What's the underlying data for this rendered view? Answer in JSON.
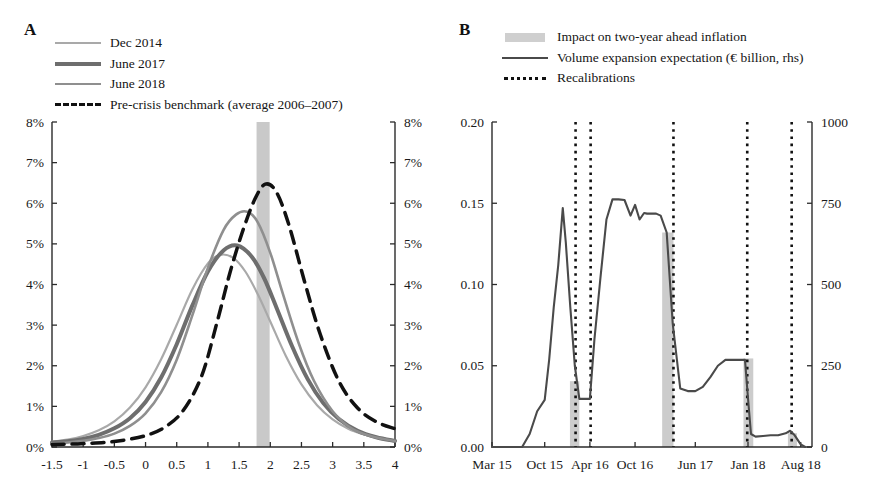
{
  "figure": {
    "panels": [
      {
        "letter": "A",
        "legend": [
          {
            "label": "Dec 2014",
            "marker": "solid-line",
            "color": "#a9a9a9",
            "width": 2.2
          },
          {
            "label": "June 2017",
            "marker": "solid-line",
            "color": "#6e6e6e",
            "width": 4.0
          },
          {
            "label": "June 2018",
            "marker": "solid-line",
            "color": "#8f8f8f",
            "width": 2.6
          },
          {
            "label": "Pre-crisis benchmark (average 2006–2007)",
            "marker": "dashed-line",
            "color": "#111111",
            "width": 3.5
          }
        ]
      },
      {
        "letter": "B",
        "legend": [
          {
            "label": "Impact on two-year ahead inflation",
            "marker": "swatch",
            "color": "#cfcfcf"
          },
          {
            "label": "Volume expansion expectation (€ billion, rhs)",
            "marker": "solid-line",
            "color": "#4a4a4a",
            "width": 2.2
          },
          {
            "label": "Recalibrations",
            "marker": "dotted-line",
            "color": "#111111",
            "width": 3.5
          }
        ]
      }
    ]
  },
  "chart_data": [
    {
      "panel": "A",
      "type": "line",
      "title": "",
      "xlabel": "",
      "ylabel": "",
      "xlim": [
        -1.5,
        4
      ],
      "ylim": [
        0,
        0.08
      ],
      "xticks": [
        "-1.5",
        "-1",
        "-0.5",
        "0",
        "0.5",
        "1",
        "1.5",
        "2",
        "2.5",
        "3",
        "3.5",
        "4"
      ],
      "xtick_values": [
        -1.5,
        -1,
        -0.5,
        0,
        0.5,
        1,
        1.5,
        2,
        2.5,
        3,
        3.5,
        4
      ],
      "yticks": [
        "0%",
        "1%",
        "2%",
        "3%",
        "4%",
        "5%",
        "6%",
        "7%",
        "8%"
      ],
      "ytick_values": [
        0,
        0.01,
        0.02,
        0.03,
        0.04,
        0.05,
        0.06,
        0.07,
        0.08
      ],
      "right_axis_yticks": [
        "0%",
        "1%",
        "2%",
        "3%",
        "4%",
        "5%",
        "6%",
        "7%",
        "8%"
      ],
      "grid": false,
      "legend_position": "top-left",
      "shaded_band": {
        "label": "target band",
        "x_start": 1.78,
        "x_end": 1.99,
        "color": "#c9c9c9"
      },
      "series": [
        {
          "name": "Dec 2014",
          "color": "#a9a9a9",
          "linewidth": 2.2,
          "style": "solid",
          "peak_x": 1.2,
          "peak_y": 0.0473,
          "x": [
            -1.5,
            -1.25,
            -1,
            -0.75,
            -0.5,
            -0.25,
            0,
            0.25,
            0.5,
            0.75,
            1,
            1.2,
            1.4,
            1.6,
            1.8,
            2,
            2.25,
            2.5,
            2.75,
            3,
            3.25,
            3.5,
            3.75,
            4
          ],
          "y": [
            0.0013,
            0.0018,
            0.0027,
            0.0041,
            0.0063,
            0.0097,
            0.0147,
            0.0216,
            0.0301,
            0.0388,
            0.0452,
            0.0473,
            0.0466,
            0.0432,
            0.0376,
            0.0309,
            0.0224,
            0.0154,
            0.0103,
            0.0068,
            0.0045,
            0.0031,
            0.0022,
            0.0016
          ]
        },
        {
          "name": "June 2017",
          "color": "#6e6e6e",
          "linewidth": 4.0,
          "style": "solid",
          "peak_x": 1.47,
          "peak_y": 0.0496,
          "x": [
            -1.5,
            -1.25,
            -1,
            -0.75,
            -0.5,
            -0.25,
            0,
            0.25,
            0.5,
            0.75,
            1,
            1.25,
            1.47,
            1.7,
            1.9,
            2.1,
            2.35,
            2.6,
            2.85,
            3.1,
            3.4,
            3.7,
            4
          ],
          "y": [
            0.0011,
            0.0014,
            0.002,
            0.003,
            0.0046,
            0.0071,
            0.0111,
            0.0171,
            0.0253,
            0.0348,
            0.0432,
            0.0484,
            0.0496,
            0.0469,
            0.0416,
            0.0343,
            0.0248,
            0.0167,
            0.0108,
            0.0069,
            0.004,
            0.0024,
            0.0015
          ]
        },
        {
          "name": "June 2018",
          "color": "#8f8f8f",
          "linewidth": 2.6,
          "style": "solid",
          "peak_x": 1.63,
          "peak_y": 0.0579,
          "x": [
            -1.5,
            -1.25,
            -1,
            -0.75,
            -0.5,
            -0.25,
            0,
            0.25,
            0.5,
            0.75,
            1,
            1.25,
            1.45,
            1.63,
            1.8,
            2,
            2.2,
            2.45,
            2.7,
            3,
            3.3,
            3.65,
            4
          ],
          "y": [
            0.0009,
            0.0011,
            0.0015,
            0.0022,
            0.0033,
            0.0052,
            0.0083,
            0.0135,
            0.0215,
            0.0324,
            0.0441,
            0.0534,
            0.0572,
            0.0579,
            0.0553,
            0.0478,
            0.0378,
            0.0258,
            0.0163,
            0.0088,
            0.0046,
            0.0025,
            0.0015
          ]
        },
        {
          "name": "Pre-crisis benchmark (average 2006–2007)",
          "color": "#111111",
          "linewidth": 3.5,
          "style": "dashed",
          "peak_x": 1.92,
          "peak_y": 0.0647,
          "x": [
            -1.5,
            -1.2,
            -0.9,
            -0.6,
            -0.3,
            0,
            0.3,
            0.6,
            0.9,
            1.15,
            1.35,
            1.55,
            1.75,
            1.92,
            2.1,
            2.3,
            2.55,
            2.8,
            3.1,
            3.4,
            3.7,
            4
          ],
          "y": [
            0.0006,
            0.0007,
            0.0009,
            0.0012,
            0.0018,
            0.0028,
            0.0048,
            0.0089,
            0.0175,
            0.0309,
            0.0427,
            0.0528,
            0.0609,
            0.0647,
            0.0627,
            0.0546,
            0.0407,
            0.0278,
            0.0162,
            0.0096,
            0.0062,
            0.0045
          ]
        }
      ]
    },
    {
      "panel": "B",
      "type": "line",
      "title": "",
      "xlabel": "",
      "ylabel": "",
      "ylim": [
        0,
        0.2
      ],
      "yticks": [
        "0.00",
        "0.05",
        "0.10",
        "0.15",
        "0.20"
      ],
      "ytick_values": [
        0,
        0.05,
        0.1,
        0.15,
        0.2
      ],
      "right_ylim": [
        0,
        1000
      ],
      "right_yticks": [
        "0",
        "250",
        "500",
        "750",
        "1000"
      ],
      "right_ytick_values": [
        0,
        250,
        500,
        750,
        1000
      ],
      "xticks": [
        "Mar 15",
        "Oct 15",
        "Apr 16",
        "Oct 16",
        "Jun 17",
        "Jan 18",
        "Aug 18"
      ],
      "xtick_positions": [
        0,
        7,
        13,
        19,
        27,
        34,
        41
      ],
      "grid": false,
      "legend_position": "top",
      "series": [
        {
          "name": "Volume expansion expectation (€ billion, rhs)",
          "color": "#4a4a4a",
          "axis": "right",
          "x": [
            0,
            1,
            2,
            3,
            4,
            5,
            6,
            7,
            7.6,
            8.2,
            8.8,
            9.4,
            9.8,
            10.4,
            11,
            11.6,
            12.2,
            13,
            13.6,
            14.4,
            15.2,
            16,
            16.8,
            17.6,
            18.4,
            19,
            19.6,
            20.2,
            20.6,
            21.2,
            21.8,
            22.4,
            23.2,
            24,
            25,
            26,
            27,
            28,
            29,
            30,
            31,
            32,
            33,
            33.6,
            34,
            34.4,
            35,
            36,
            37,
            38,
            39,
            39.6,
            40.2,
            41,
            41.6
          ],
          "y_right": [
            0,
            0,
            0,
            0,
            0,
            40,
            110,
            145,
            270,
            430,
            560,
            735,
            630,
            430,
            250,
            148,
            148,
            148,
            330,
            520,
            700,
            762,
            762,
            760,
            712,
            745,
            700,
            720,
            718,
            718,
            718,
            712,
            660,
            380,
            180,
            172,
            172,
            185,
            215,
            250,
            268,
            268,
            268,
            268,
            150,
            40,
            32,
            34,
            36,
            36,
            42,
            50,
            36,
            8,
            0
          ],
          "y_left_equiv": [
            0,
            0,
            0,
            0,
            0,
            0.008,
            0.022,
            0.029,
            0.054,
            0.086,
            0.112,
            0.147,
            0.126,
            0.086,
            0.05,
            0.0296,
            0.0296,
            0.0296,
            0.066,
            0.104,
            0.14,
            0.1524,
            0.1524,
            0.152,
            0.1424,
            0.149,
            0.14,
            0.144,
            0.1436,
            0.1436,
            0.1436,
            0.1424,
            0.132,
            0.076,
            0.036,
            0.0344,
            0.0344,
            0.037,
            0.043,
            0.05,
            0.0536,
            0.0536,
            0.0536,
            0.0536,
            0.03,
            0.008,
            0.0064,
            0.0068,
            0.0072,
            0.0072,
            0.0084,
            0.01,
            0.0072,
            0.0016,
            0
          ]
        }
      ],
      "bars": {
        "name": "Impact on two-year ahead inflation",
        "color": "#cccccc",
        "axis": "left",
        "items": [
          {
            "x_start": 10.35,
            "x_end": 11.6,
            "value": 0.0405
          },
          {
            "x_start": 22.6,
            "x_end": 24.1,
            "value": 0.132
          },
          {
            "x_start": 33.4,
            "x_end": 34.7,
            "value": 0.0545
          },
          {
            "x_start": 39.3,
            "x_end": 40.5,
            "value": 0.0085
          }
        ]
      },
      "recalibrations": {
        "name": "Recalibrations",
        "color": "#111111",
        "x_positions": [
          11.1,
          13.1,
          24.1,
          33.9,
          39.8
        ]
      }
    }
  ]
}
